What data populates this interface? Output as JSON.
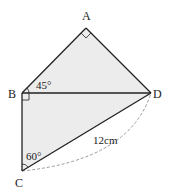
{
  "diagram": {
    "vertices": {
      "A": "A",
      "B": "B",
      "C": "C",
      "D": "D"
    },
    "angles": {
      "ABD": "45°",
      "BCD": "60°"
    },
    "right_angles": [
      "BAD",
      "DBC"
    ],
    "lengths": {
      "CD": "12cm"
    },
    "arc": "CD (dashed)",
    "colors": {
      "fill": "#ececec",
      "stroke": "#222222",
      "dashed": "#999999"
    }
  }
}
